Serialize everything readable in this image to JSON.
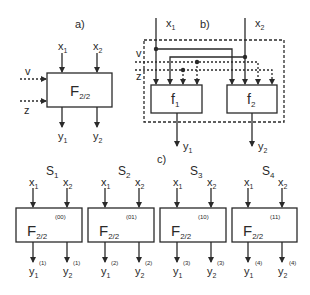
{
  "diagram": {
    "panel_a": {
      "label": "a)",
      "block": {
        "name": "F",
        "sub": "2/2"
      },
      "inputs": [
        {
          "name": "x",
          "sub": "1"
        },
        {
          "name": "x",
          "sub": "2"
        }
      ],
      "side_inputs": [
        "v",
        "z"
      ],
      "outputs": [
        {
          "name": "y",
          "sub": "1"
        },
        {
          "name": "y",
          "sub": "2"
        }
      ]
    },
    "panel_b": {
      "label": "b)",
      "blocks": [
        {
          "name": "f",
          "sub": "1"
        },
        {
          "name": "f",
          "sub": "2"
        }
      ],
      "inputs": [
        {
          "name": "x",
          "sub": "1"
        },
        {
          "name": "x",
          "sub": "2"
        }
      ],
      "side_inputs": [
        "v",
        "z"
      ],
      "outputs": [
        {
          "name": "y",
          "sub": "1"
        },
        {
          "name": "y",
          "sub": "2"
        }
      ]
    },
    "panel_c": {
      "label": "c)",
      "states": [
        {
          "name": "S",
          "sub": "1",
          "code": "(00)",
          "block": "F",
          "block_sub": "2/2",
          "out_sup": "(1)"
        },
        {
          "name": "S",
          "sub": "2",
          "code": "(01)",
          "block": "F",
          "block_sub": "2/2",
          "out_sup": "(2)"
        },
        {
          "name": "S",
          "sub": "3",
          "code": "(10)",
          "block": "F",
          "block_sub": "2/2",
          "out_sup": "(3)"
        },
        {
          "name": "S",
          "sub": "4",
          "code": "(11)",
          "block": "F",
          "block_sub": "2/2",
          "out_sup": "(4)"
        }
      ],
      "inputs": [
        {
          "name": "x",
          "sub": "1"
        },
        {
          "name": "x",
          "sub": "2"
        }
      ],
      "outputs": [
        {
          "name": "y",
          "sub": "1"
        },
        {
          "name": "y",
          "sub": "2"
        }
      ]
    },
    "colors": {
      "line": "#2a2a2a",
      "background": "#ffffff"
    }
  }
}
